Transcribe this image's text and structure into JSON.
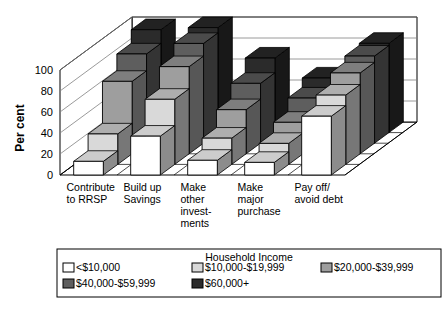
{
  "chart_data": {
    "type": "bar",
    "title": "",
    "subtitle": "",
    "xlabel": "",
    "ylabel": "Per cent",
    "ylim": [
      0,
      100
    ],
    "yticks": [
      0,
      20,
      40,
      60,
      80,
      100
    ],
    "ytick_labels": [
      "0",
      "20",
      "40",
      "60",
      "80",
      "100"
    ],
    "grid": true,
    "threeD": true,
    "legend_position": "bottom",
    "legend_title": "Household Income",
    "categories": [
      "Contribute to RRSP",
      "Build up Savings",
      "Make other invest- ments",
      "Make major purchase",
      "Pay off/ avoid debt"
    ],
    "category_lines": [
      [
        "Contribute",
        "to RRSP"
      ],
      [
        "Build up",
        "Savings"
      ],
      [
        "Make",
        "other",
        "invest-",
        "ments"
      ],
      [
        "Make",
        "major",
        "purchase"
      ],
      [
        "Pay off/",
        "avoid debt"
      ]
    ],
    "series": [
      {
        "name": "<$10,000",
        "color": "#ffffff",
        "values": [
          13,
          37,
          14,
          12,
          56
        ]
      },
      {
        "name": "$10,000-$19,999",
        "color": "#d9d9d9",
        "values": [
          29,
          62,
          25,
          20,
          66
        ]
      },
      {
        "name": "$20,000-$39,999",
        "color": "#9e9e9e",
        "values": [
          69,
          83,
          42,
          30,
          77
        ]
      },
      {
        "name": "$40,000-$59,999",
        "color": "#5e5e5e",
        "values": [
          85,
          95,
          57,
          43,
          83
        ]
      },
      {
        "name": "$60,000+",
        "color": "#2b2b2b",
        "values": [
          98,
          100,
          71,
          52,
          85
        ]
      }
    ]
  },
  "axis": {
    "y_title": "Per cent"
  },
  "legend": {
    "title": "Household Income",
    "entries": [
      {
        "label": "<$10,000",
        "color": "#ffffff"
      },
      {
        "label": "$10,000-$19,999",
        "color": "#d9d9d9"
      },
      {
        "label": "$20,000-$39,999",
        "color": "#9e9e9e"
      },
      {
        "label": "$40,000-$59,999",
        "color": "#5e5e5e"
      },
      {
        "label": "$60,000+",
        "color": "#2b2b2b"
      }
    ]
  }
}
